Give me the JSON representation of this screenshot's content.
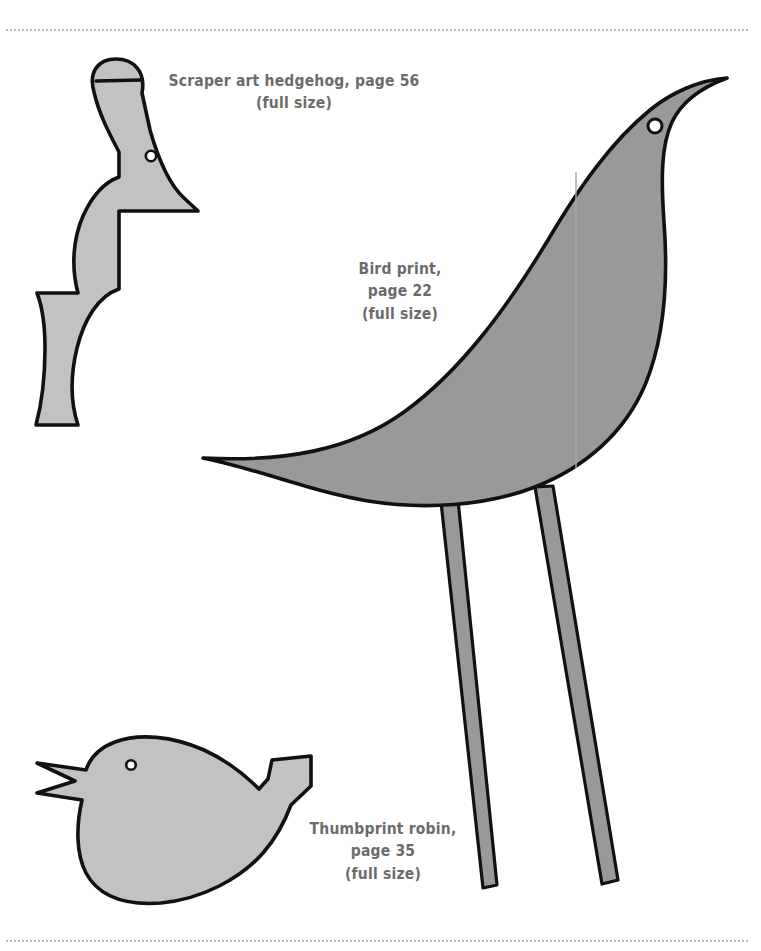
{
  "sheet": {
    "width": 761,
    "height": 951,
    "background_color": "#ffffff",
    "caption_color": "#6b6b6b",
    "rule_color": "#b9b9b9",
    "outline_color": "#111111"
  },
  "rules": {
    "top_label": "top-dotted-rule",
    "bottom_label": "bottom-dotted-rule"
  },
  "captions": {
    "hedgehog": "Scraper art hedgehog, page 56\n(full size)",
    "bird": "Bird print,\npage 22\n(full size)",
    "robin": "Thumbprint robin,\npage 35\n(full size)"
  },
  "templates": [
    {
      "id": "hedgehog",
      "name": "Scraper art hedgehog",
      "page": 56,
      "scale_note": "(full size)",
      "fill_color": "#c2c2c2",
      "has_eye_hole": true
    },
    {
      "id": "bird",
      "name": "Bird print",
      "page": 22,
      "scale_note": "(full size)",
      "fill_color": "#999999",
      "has_eye_hole": true
    },
    {
      "id": "robin",
      "name": "Thumbprint robin",
      "page": 35,
      "scale_note": "(full size)",
      "fill_color": "#c2c2c2",
      "has_eye_hole": true
    }
  ]
}
